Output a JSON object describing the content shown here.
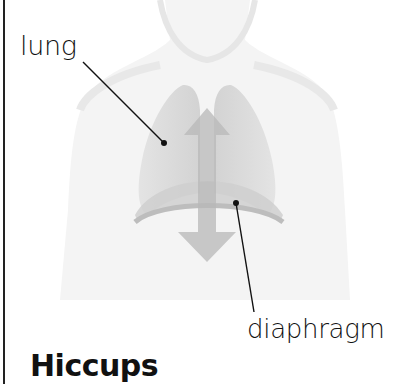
{
  "title": "Hiccups",
  "labels": {
    "lung": "lung",
    "diaphragm": "diaphragm"
  },
  "illustration": {
    "subject": "human torso with lungs and diaphragm",
    "arrow": "double-headed vertical arrow (up/down)",
    "colors": {
      "body": "#f2f2f2",
      "lung": "#d9d9d9",
      "diaphragm": "#c8c8c8",
      "arrow": "#bdbdbd",
      "line": "#111111"
    }
  }
}
